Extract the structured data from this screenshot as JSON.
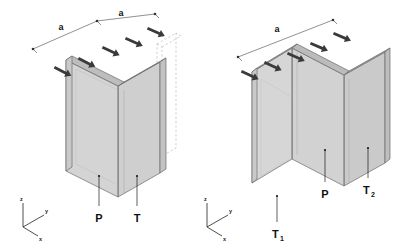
{
  "figure": {
    "background_color": "#ffffff",
    "panel_count": 2
  },
  "style": {
    "face_light": "#d4d4d4",
    "face_mid": "#c6c6c6",
    "face_dark": "#b2b2b2",
    "edge_color": "#6a6a6a",
    "outline_color": "#4a4a4a",
    "arrow_color": "#3a3a3a",
    "dim_line_color": "#555555",
    "ghost_color": "#b9b9b9",
    "leader_color": "#1a1a1a",
    "text_color": "#111111"
  },
  "panels": [
    {
      "id": "left",
      "name": "angle-section-panel",
      "geometry": "L-shaped angle formed by plate P and plate T",
      "has_ghost_outline": true,
      "ghost_note": "dashed outline of displaced plate position",
      "dimensions": [
        {
          "label": "a",
          "segment": 1
        },
        {
          "label": "a",
          "segment": 2
        }
      ],
      "load_arrows": {
        "count": 5,
        "direction": "down-right",
        "meaning": "distributed edge load"
      },
      "callouts": [
        {
          "label": "P",
          "subscript": "",
          "name": "plate-p"
        },
        {
          "label": "T",
          "subscript": "",
          "name": "plate-t"
        }
      ],
      "axes": {
        "z": "z",
        "y": "y",
        "x": "x"
      }
    },
    {
      "id": "right",
      "name": "channel-section-panel",
      "geometry": "U-shaped channel formed by web P and flanges T1 and T2",
      "has_ghost_outline": false,
      "dimensions": [
        {
          "label": "a",
          "segment": 1
        }
      ],
      "load_arrows": {
        "count": 5,
        "direction": "down-right",
        "meaning": "distributed edge load"
      },
      "callouts": [
        {
          "label": "T",
          "subscript": "1",
          "name": "plate-t1"
        },
        {
          "label": "P",
          "subscript": "",
          "name": "plate-p"
        },
        {
          "label": "T",
          "subscript": "2",
          "name": "plate-t2"
        }
      ],
      "axes": {
        "z": "z",
        "y": "y",
        "x": "x"
      }
    }
  ]
}
